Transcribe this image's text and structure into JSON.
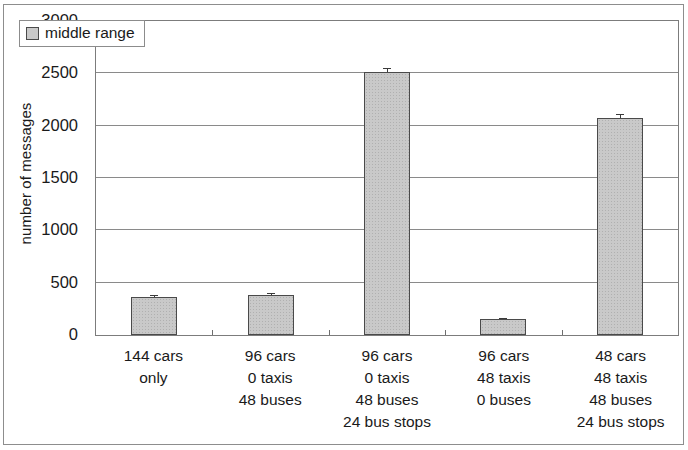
{
  "chart_data": {
    "type": "bar",
    "title": "",
    "subtitle": "",
    "xlabel": "",
    "ylabel": "number of messages",
    "ylim": [
      0,
      3000
    ],
    "ytick_labels": [
      "0",
      "500",
      "1000",
      "1500",
      "2000",
      "2500",
      "3000"
    ],
    "ytick_values": [
      0,
      500,
      1000,
      1500,
      2000,
      2500,
      3000
    ],
    "grid": true,
    "legend_position": "top-left",
    "legend": [
      "middle range"
    ],
    "categories": [
      "144 cars\nonly",
      "96 cars\n0 taxis\n48 buses",
      "96 cars\n0 taxis\n48 buses\n24 bus stops",
      "96 cars\n48 taxis\n0 buses",
      "48 cars\n48 taxis\n48 buses\n24 bus stops"
    ],
    "category_lines": [
      [
        "144 cars",
        "only"
      ],
      [
        "96 cars",
        "0 taxis",
        "48 buses"
      ],
      [
        "96 cars",
        "0 taxis",
        "48 buses",
        "24 bus stops"
      ],
      [
        "96 cars",
        "48 taxis",
        "0 buses"
      ],
      [
        "48 cars",
        "48 taxis",
        "48 buses",
        "24 bus stops"
      ]
    ],
    "series": [
      {
        "name": "middle range",
        "values": [
          365,
          385,
          2510,
          150,
          2070
        ],
        "errors": [
          15,
          15,
          40,
          8,
          40
        ],
        "color": "#c9c9c9"
      }
    ]
  },
  "legend": {
    "label": "middle range",
    "swatch_color": "#c9c9c9"
  },
  "axes": {
    "y_title": "number of messages"
  }
}
